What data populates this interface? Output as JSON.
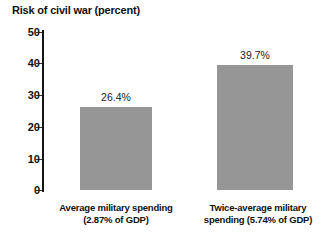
{
  "chart_data": {
    "type": "bar",
    "title": "Risk of civil war (percent)",
    "xlabel": "",
    "ylabel": "",
    "ylim": [
      0,
      50
    ],
    "yticks": [
      0,
      10,
      20,
      30,
      40,
      50
    ],
    "ytick_labels": [
      "0",
      "10",
      "20",
      "30",
      "40",
      "50"
    ],
    "grid": false,
    "legend": false,
    "bar_color": "#969696",
    "axis_color": "#141414",
    "text_color": "#111111",
    "categories": [
      "Average military spending (2.87% of GDP)",
      "Twice-average military spending (5.74% of GDP)"
    ],
    "category_lines": [
      [
        "Average military spending",
        "(2.87% of GDP)"
      ],
      [
        "Twice-average military",
        "spending (5.74% of GDP)"
      ]
    ],
    "values": [
      26.4,
      39.7
    ],
    "value_labels": [
      "26.4%",
      "39.7%"
    ]
  }
}
